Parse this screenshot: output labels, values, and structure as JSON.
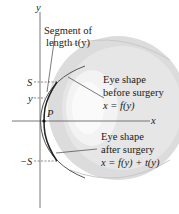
{
  "diagram": {
    "axes": {
      "x_label": "x",
      "y_label": "y"
    },
    "tick_labels": {
      "S": "S",
      "y": "y",
      "neg_S": "−S"
    },
    "point_label": "P",
    "annotations": {
      "segment": {
        "line1": "Segment of",
        "line2": "length t(y)"
      },
      "before": {
        "line1": "Eye shape",
        "line2": "before surgery",
        "line3": "x = f(y)"
      },
      "after": {
        "line1": "Eye shape",
        "line2": "after surgery",
        "line3": "x = f(y) + t(y)"
      }
    },
    "colors": {
      "eye_fill": "#d9d9d9",
      "eye_inner": "#ebebeb",
      "curve": "#333333",
      "axis": "#444444"
    }
  }
}
